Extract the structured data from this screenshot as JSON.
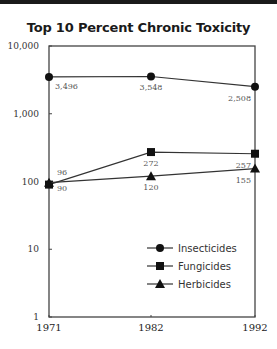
{
  "chart_data": {
    "type": "line",
    "title": "Top 10 Percent Chronic Toxicity",
    "xlabel": "",
    "ylabel": "",
    "yscale": "log",
    "ylim": [
      1,
      10000
    ],
    "yticks": [
      "1",
      "10",
      "100",
      "1,000",
      "10,000"
    ],
    "categories": [
      "1971",
      "1982",
      "1992"
    ],
    "series": [
      {
        "name": "Insecticides",
        "marker": "circle",
        "values": [
          3496,
          3548,
          2508
        ],
        "labels": [
          "3,496",
          "3,548",
          "2,508"
        ]
      },
      {
        "name": "Fungicides",
        "marker": "square",
        "values": [
          90,
          272,
          257
        ],
        "labels": [
          "90",
          "272",
          "257"
        ]
      },
      {
        "name": "Herbicides",
        "marker": "triangle",
        "values": [
          96,
          120,
          155
        ],
        "labels": [
          "96",
          "120",
          "155"
        ]
      }
    ],
    "grid": false,
    "legend_position": "lower right inside"
  }
}
